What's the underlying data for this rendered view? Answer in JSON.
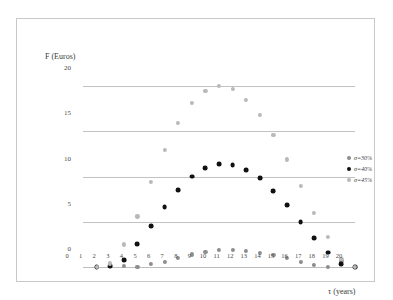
{
  "chart_data": {
    "type": "scatter",
    "title": "",
    "xlabel": "τ (years)",
    "ylabel": "F (Euros)",
    "xlim": [
      0,
      20
    ],
    "ylim": [
      0,
      21
    ],
    "xticks": [
      "0",
      "1",
      "2",
      "3",
      "4",
      "5",
      "6",
      "7",
      "8",
      "9",
      "10",
      "11",
      "12",
      "13",
      "14",
      "15",
      "16",
      "17",
      "18",
      "19",
      "20"
    ],
    "yticks": [
      "0",
      "5",
      "10",
      "15",
      "20"
    ],
    "grid": "horizontal",
    "legend_position": "right",
    "x": [
      1,
      2,
      3,
      4,
      5,
      6,
      7,
      8,
      9,
      10,
      11,
      12,
      13,
      14,
      15,
      16,
      17,
      18,
      19,
      20
    ],
    "series": [
      {
        "name": "σ=30%",
        "color": "#8d8d8d",
        "values": [
          0.0,
          0.1,
          0.1,
          0.0,
          0.3,
          0.6,
          1.0,
          1.4,
          1.7,
          1.9,
          1.9,
          1.8,
          1.6,
          1.3,
          1.0,
          0.6,
          0.2,
          0.0,
          0.7,
          0.0
        ]
      },
      {
        "name": "σ=40%",
        "color": "#111111",
        "values": [
          0.0,
          0.1,
          0.8,
          2.5,
          4.5,
          6.6,
          8.5,
          10.0,
          10.9,
          11.4,
          11.3,
          10.7,
          9.8,
          8.4,
          6.8,
          5.0,
          3.2,
          1.6,
          0.3,
          0.0
        ]
      },
      {
        "name": "σ=45%",
        "color": "#b9b9b9",
        "values": [
          0.0,
          0.4,
          2.5,
          5.6,
          9.4,
          12.9,
          15.9,
          18.1,
          19.5,
          20.0,
          19.7,
          18.5,
          16.8,
          14.6,
          11.9,
          9.0,
          6.0,
          3.3,
          0.9,
          0.0
        ]
      }
    ]
  },
  "legend": {
    "items": [
      {
        "label": "σ=30%"
      },
      {
        "label": "σ=40%"
      },
      {
        "label": "σ=45%"
      }
    ]
  }
}
